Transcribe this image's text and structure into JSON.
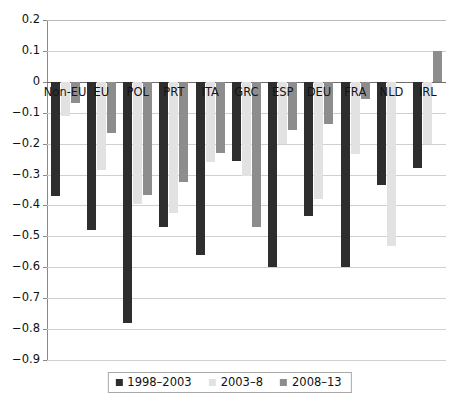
{
  "chart_data": {
    "type": "bar",
    "title": "",
    "subtitle": "",
    "xlabel": "",
    "ylabel": "",
    "ylim": [
      -0.9,
      0.2
    ],
    "ytick_step": 0.1,
    "yticks": [
      "0.2",
      "0.1",
      "0",
      "-0.1",
      "-0.2",
      "-0.3",
      "-0.4",
      "-0.5",
      "-0.6",
      "-0.7",
      "-0.8",
      "-0.9"
    ],
    "ytick_values": [
      0.2,
      0.1,
      0,
      -0.1,
      -0.2,
      -0.3,
      -0.4,
      -0.5,
      -0.6,
      -0.7,
      -0.8,
      -0.9
    ],
    "grid": true,
    "grid_axis": "y",
    "legend_position": "bottom",
    "categories": [
      "Non-EU",
      "EU",
      "POL",
      "PRT",
      "ITA",
      "GRC",
      "ESP",
      "DEU",
      "FRA",
      "NLD",
      "IRL"
    ],
    "series": [
      {
        "name": "1998–2003",
        "color": "#2e2e2e",
        "values": [
          -0.37,
          -0.48,
          -0.78,
          -0.47,
          -0.56,
          -0.255,
          -0.6,
          -0.435,
          -0.6,
          -0.335,
          -0.28
        ]
      },
      {
        "name": "2003–8",
        "color": "#e2e2e2",
        "values": [
          -0.11,
          -0.285,
          -0.395,
          -0.425,
          -0.26,
          -0.305,
          -0.2,
          -0.38,
          -0.235,
          -0.53,
          -0.2
        ]
      },
      {
        "name": "2008–13",
        "color": "#8d8d8d",
        "values": [
          -0.07,
          -0.165,
          -0.365,
          -0.325,
          -0.23,
          -0.47,
          -0.155,
          -0.135,
          -0.055,
          0.0,
          0.1
        ]
      }
    ],
    "annotations": []
  },
  "legend": {
    "items": [
      {
        "label": "1998–2003"
      },
      {
        "label": "2003–8"
      },
      {
        "label": "2008–13"
      }
    ]
  }
}
